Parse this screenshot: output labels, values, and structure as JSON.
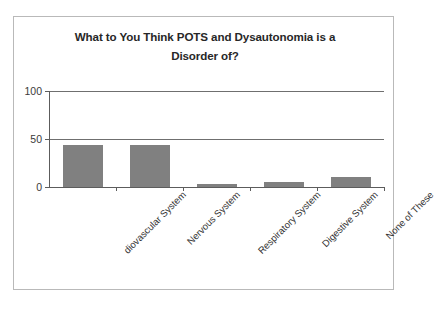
{
  "chart_data": {
    "type": "bar",
    "title": "What to You Think POTS and Dysautonomia is a Disorder of?",
    "title_line1": "What to You Think POTS and Dysautonomia is a",
    "title_line2": "Disorder of?",
    "xlabel": "",
    "ylabel": "",
    "ylim": [
      0,
      100
    ],
    "yticks": [
      "0",
      "50",
      "100"
    ],
    "ytick_values": [
      0,
      50,
      100
    ],
    "grid": true,
    "legend": false,
    "legend_position": "none",
    "bar_color": "#808080",
    "categories": [
      "Cardiovascular System",
      "Nervous System",
      "Respiratory System",
      "Digestive System",
      "None of These"
    ],
    "category_labels_rendered": [
      "diovascular System",
      "Nervous System",
      "Respiratory System",
      "Digestive System",
      "None of These"
    ],
    "values": [
      44,
      44,
      3,
      5,
      10
    ]
  }
}
